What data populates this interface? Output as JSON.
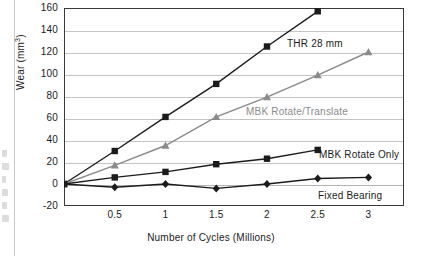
{
  "chart_data": {
    "type": "line",
    "title": "",
    "xlabel": "Number of Cycles (Millions)",
    "ylabel": "Wear (mm³)",
    "xlim": [
      0,
      3.35
    ],
    "ylim": [
      -20,
      160
    ],
    "ytick_step": 20,
    "grid": "horizontal",
    "legend_position": "inline-annotations",
    "xticks": [
      "0.5",
      "1",
      "1.5",
      "2",
      "2.5",
      "3"
    ],
    "xtick_values": [
      0.5,
      1,
      1.5,
      2,
      2.5,
      3
    ],
    "yticks": [
      "160",
      "140",
      "120",
      "100",
      "80",
      "60",
      "40",
      "20",
      "0",
      "-20"
    ],
    "ytick_values": [
      160,
      140,
      120,
      100,
      80,
      60,
      40,
      20,
      0,
      -20
    ],
    "series": [
      {
        "name": "THR 28 mm",
        "color": "#1b1b1b",
        "marker": "square",
        "x": [
          0,
          0.5,
          1,
          1.5,
          2,
          2.5
        ],
        "values": [
          0,
          30,
          61,
          91,
          125,
          157
        ]
      },
      {
        "name": "MBK Rotate/Translate",
        "color": "#8a8a8a",
        "marker": "triangle",
        "x": [
          0,
          0.5,
          1,
          1.5,
          2,
          2.5,
          3
        ],
        "values": [
          0,
          17,
          35,
          61,
          79,
          99,
          120
        ]
      },
      {
        "name": "MBK Rotate Only",
        "color": "#1b1b1b",
        "marker": "square",
        "x": [
          0,
          0.5,
          1,
          1.5,
          2,
          2.5
        ],
        "values": [
          0,
          6,
          11,
          18,
          23,
          31
        ]
      },
      {
        "name": "Fixed Bearing",
        "color": "#1b1b1b",
        "marker": "diamond",
        "x": [
          0,
          0.5,
          1,
          1.5,
          2,
          2.5,
          3
        ],
        "values": [
          0,
          -3,
          0,
          -4,
          0,
          5,
          6
        ]
      }
    ],
    "annotations": [
      {
        "text": "THR 28 mm",
        "color": "#1b1b1b"
      },
      {
        "text": "MBK Rotate/Translate",
        "color": "#8a8a8a"
      },
      {
        "text": "MBK Rotate Only",
        "color": "#1b1b1b"
      },
      {
        "text": "Fixed Bearing",
        "color": "#1b1b1b"
      }
    ]
  }
}
